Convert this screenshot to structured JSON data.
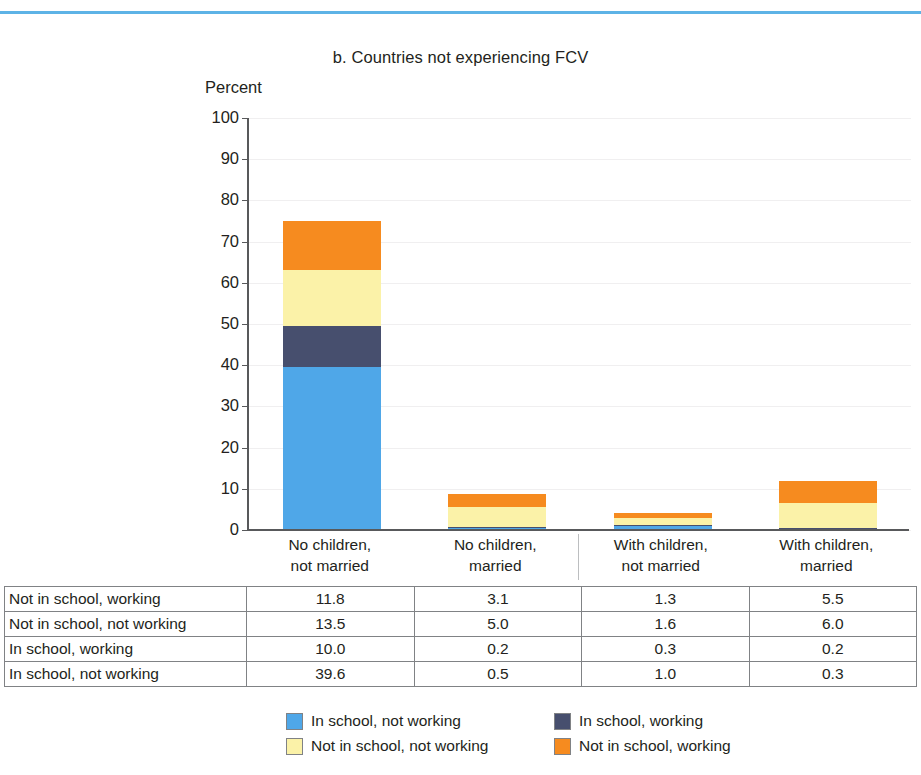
{
  "figure": {
    "title": "b. Countries not experiencing FCV",
    "axis_title": "Percent"
  },
  "colors": {
    "blue": "#4FA7E8",
    "navy": "#474F6E",
    "yellow": "#FBF2A8",
    "orange": "#F68B1F",
    "rule": "#5DB3E6",
    "axis": "#58595B",
    "grid": "#F0EFF0",
    "table_border": "#808285"
  },
  "yaxis": {
    "labels": [
      "100",
      "90",
      "80",
      "70",
      "60",
      "50",
      "40",
      "30",
      "20",
      "10",
      "0"
    ]
  },
  "categories": [
    {
      "line1": "No children,",
      "line2": "not married"
    },
    {
      "line1": "No children,",
      "line2": "married"
    },
    {
      "line1": "With children,",
      "line2": "not married"
    },
    {
      "line1": "With children,",
      "line2": "married"
    }
  ],
  "table": {
    "rows": [
      {
        "label": "Not in school, working",
        "values": [
          "11.8",
          "3.1",
          "1.3",
          "5.5"
        ]
      },
      {
        "label": "Not in school, not working",
        "values": [
          "13.5",
          "5.0",
          "1.6",
          "6.0"
        ]
      },
      {
        "label": "In school, working",
        "values": [
          "10.0",
          "0.2",
          "0.3",
          "0.2"
        ]
      },
      {
        "label": "In school, not working",
        "values": [
          "39.6",
          "0.5",
          "1.0",
          "0.3"
        ]
      }
    ]
  },
  "legend": {
    "items": [
      {
        "label": "In school, not working",
        "color": "#4FA7E8"
      },
      {
        "label": "In school, working",
        "color": "#474F6E"
      },
      {
        "label": "Not in school, not working",
        "color": "#FBF2A8"
      },
      {
        "label": "Not in school, working",
        "color": "#F68B1F"
      }
    ]
  },
  "chart_data": {
    "type": "bar",
    "subtype": "stacked",
    "title": "b. Countries not experiencing FCV",
    "xlabel": "",
    "ylabel": "Percent",
    "ylim": [
      0,
      100
    ],
    "yticks": [
      0,
      10,
      20,
      30,
      40,
      50,
      60,
      70,
      80,
      90,
      100
    ],
    "grid": true,
    "legend_position": "bottom",
    "categories": [
      "No children, not married",
      "No children, married",
      "With children, not married",
      "With children, married"
    ],
    "series": [
      {
        "name": "In school, not working",
        "color": "#4FA7E8",
        "values": [
          39.6,
          0.5,
          1.0,
          0.3
        ]
      },
      {
        "name": "In school, working",
        "color": "#474F6E",
        "values": [
          10.0,
          0.2,
          0.3,
          0.2
        ]
      },
      {
        "name": "Not in school, not working",
        "color": "#FBF2A8",
        "values": [
          13.5,
          5.0,
          1.6,
          6.0
        ]
      },
      {
        "name": "Not in school, working",
        "color": "#F68B1F",
        "values": [
          11.8,
          3.1,
          1.3,
          5.5
        ]
      }
    ],
    "totals": [
      74.9,
      8.8,
      4.2,
      12.0
    ]
  }
}
